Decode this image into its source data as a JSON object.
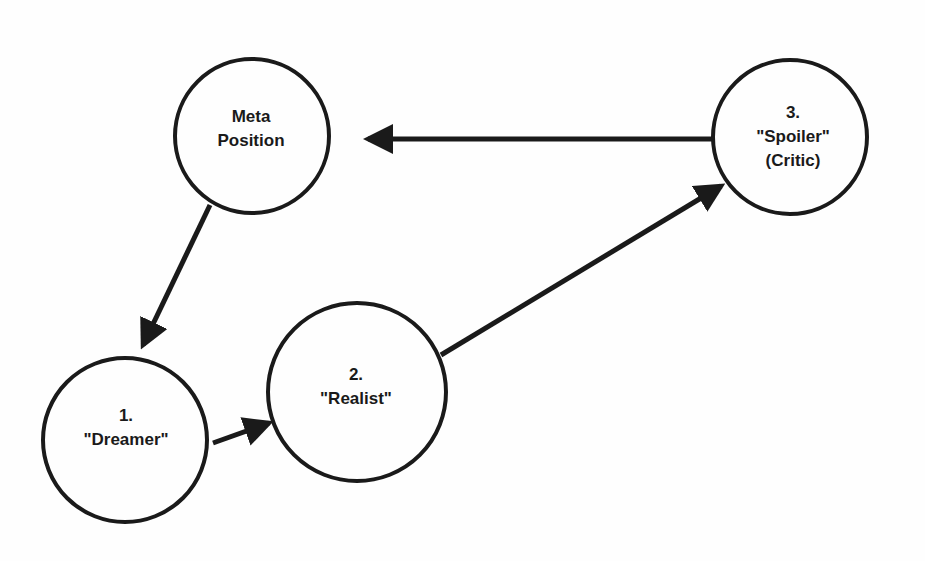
{
  "diagram": {
    "type": "cycle",
    "stroke_color": "#1a1a1a",
    "background": "#fefefe",
    "nodes": [
      {
        "id": "meta",
        "lines": [
          "Meta",
          "Position"
        ],
        "cx": 252,
        "cy": 136,
        "r": 77,
        "label_x": 251,
        "label_y": 129
      },
      {
        "id": "spoiler",
        "lines": [
          "3.",
          "\"Spoiler\"",
          "(Critic)"
        ],
        "cx": 790,
        "cy": 137,
        "r": 77,
        "label_x": 793,
        "label_y": 137
      },
      {
        "id": "dreamer",
        "lines": [
          "1.",
          "\"Dreamer\""
        ],
        "cx": 125,
        "cy": 440,
        "r": 82,
        "label_x": 126,
        "label_y": 428
      },
      {
        "id": "realist",
        "lines": [
          "2.",
          "\"Realist\""
        ],
        "cx": 357,
        "cy": 392,
        "r": 89,
        "label_x": 356,
        "label_y": 387
      }
    ],
    "edges": [
      {
        "from": "meta",
        "to": "dreamer",
        "x1": 210,
        "y1": 205,
        "x2": 143,
        "y2": 345
      },
      {
        "from": "dreamer",
        "to": "realist",
        "x1": 213,
        "y1": 443,
        "x2": 269,
        "y2": 423
      },
      {
        "from": "realist",
        "to": "spoiler",
        "x1": 441,
        "y1": 355,
        "x2": 721,
        "y2": 186
      },
      {
        "from": "spoiler",
        "to": "meta",
        "x1": 714,
        "y1": 139,
        "x2": 368,
        "y2": 139
      }
    ]
  }
}
